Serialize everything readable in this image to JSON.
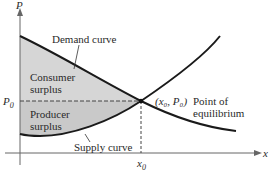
{
  "diagram": {
    "axes": {
      "y_label": "P",
      "x_label": "x"
    },
    "labels": {
      "demand": "Demand curve",
      "supply": "Supply curve",
      "consumer_line1": "Consumer",
      "consumer_line2": "surplus",
      "producer_line1": "Producer",
      "producer_line2": "surplus",
      "p0": "P",
      "p0_sub": "0",
      "x0": "x",
      "x0_sub": "0",
      "eq_coord": "(x₀, P₀)",
      "eq_line1": "Point of",
      "eq_line2": "equilibrium"
    },
    "colors": {
      "shade": "#d4d4d4",
      "curve": "#1a1a1a",
      "axis": "#555555"
    }
  }
}
